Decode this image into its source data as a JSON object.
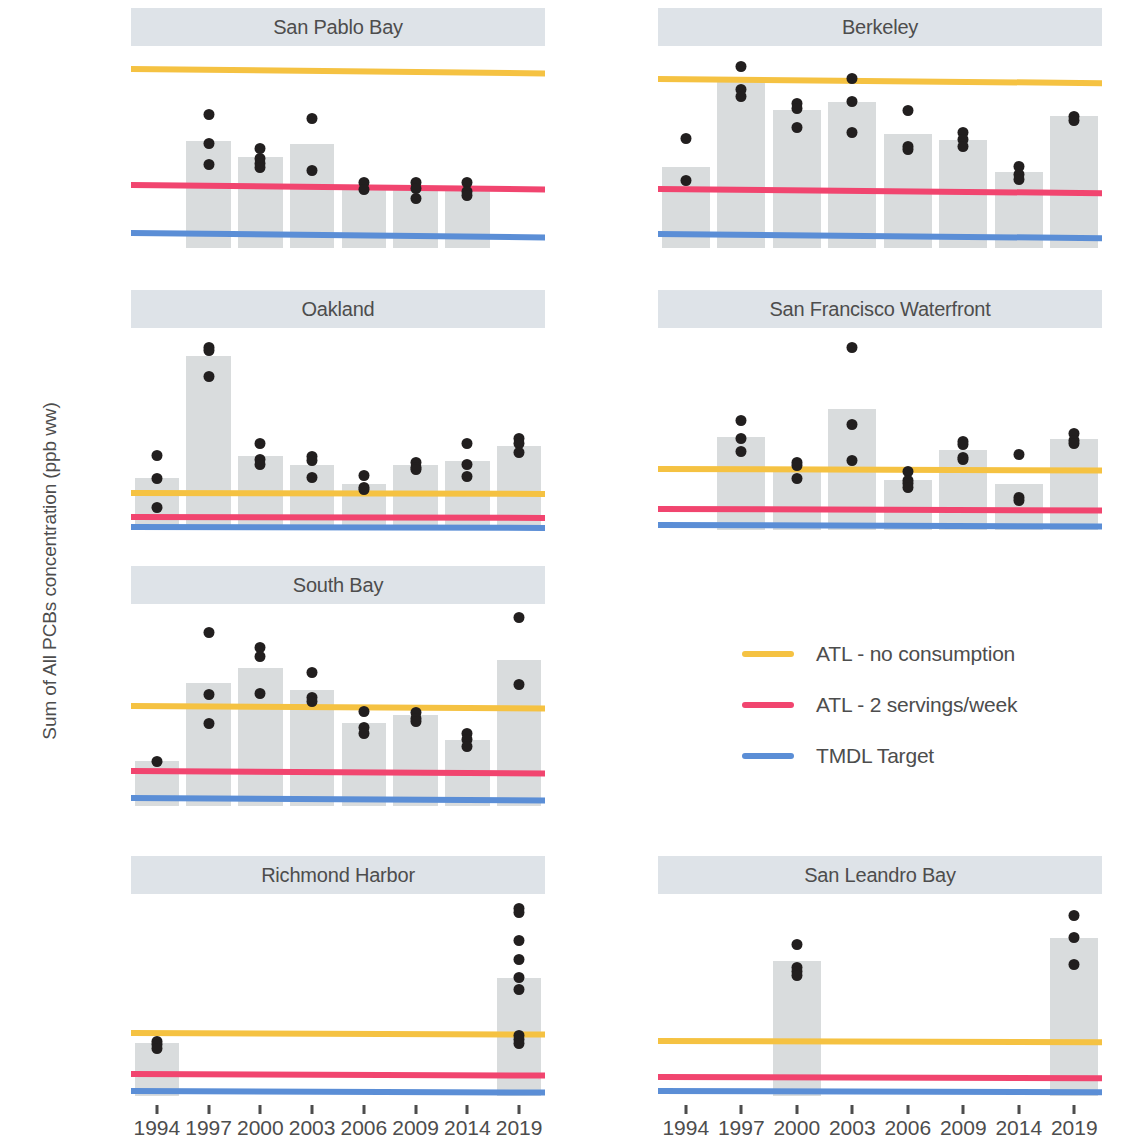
{
  "chart_data": {
    "type": "bar",
    "title": "",
    "xlabel": "",
    "ylabel": "Sum of All PCBs concentration (ppb ww)",
    "grid": false,
    "legend_position": "middle-right",
    "categories": [
      "1994",
      "1997",
      "2000",
      "2003",
      "2006",
      "2009",
      "2014",
      "2019"
    ],
    "reference_lines": [
      {
        "name": "ATL - no consumption",
        "color": "#f5c242",
        "value_left": 120,
        "value_right": 117
      },
      {
        "name": "ATL - 2 servings/week",
        "color": "#f1456f",
        "value_left": 42,
        "value_right": 39
      },
      {
        "name": "TMDL Target",
        "color": "#5b8ed6",
        "value_left": 10,
        "value_right": 7
      }
    ],
    "facets": [
      {
        "title": "San Pablo Bay",
        "row": 0,
        "col": 0,
        "ylim": [
          0,
          133
        ],
        "yticks": [
          0,
          25,
          50,
          75,
          100,
          125
        ],
        "bars": [
          null,
          72,
          61,
          70,
          40,
          39,
          39,
          null
        ],
        "points": [
          [],
          [
            90,
            70,
            56
          ],
          [
            67,
            60,
            57,
            54
          ],
          [
            87,
            52
          ],
          [
            44,
            39
          ],
          [
            44,
            40,
            33
          ],
          [
            44,
            38,
            35
          ],
          []
        ]
      },
      {
        "title": "Berkeley",
        "row": 0,
        "col": 1,
        "ylim": [
          0,
          141
        ],
        "yticks": [
          0,
          50,
          100
        ],
        "bars": [
          58,
          119,
          98,
          104,
          81,
          77,
          54,
          94
        ],
        "points": [
          [
            78,
            48
          ],
          [
            129,
            113,
            108
          ],
          [
            103,
            99,
            86
          ],
          [
            121,
            104,
            82
          ],
          [
            98,
            72,
            70
          ],
          [
            82,
            77,
            72
          ],
          [
            58,
            52,
            49
          ],
          [
            94,
            91
          ]
        ]
      },
      {
        "title": "Oakland",
        "row": 1,
        "col": 0,
        "ylim": [
          0,
          650
        ],
        "yticks": [
          0,
          200,
          400,
          600
        ],
        "bars": [
          170,
          570,
          243,
          213,
          152,
          213,
          227,
          277
        ],
        "points": [
          [
            245,
            168,
            74
          ],
          [
            600,
            588,
            503
          ],
          [
            285,
            230,
            215
          ],
          [
            240,
            228,
            172
          ],
          [
            180,
            140,
            133
          ],
          [
            222,
            205,
            198
          ],
          [
            285,
            215,
            175
          ],
          [
            300,
            283,
            255
          ]
        ]
      },
      {
        "title": "San Francisco Waterfront",
        "row": 1,
        "col": 1,
        "ylim": [
          0,
          390
        ],
        "yticks": [
          0,
          100,
          200,
          300
        ],
        "bars": [
          null,
          183,
          121,
          238,
          99,
          158,
          90,
          179
        ],
        "points": [
          [],
          [
            215,
            180,
            155
          ],
          [
            133,
            127,
            102
          ],
          [
            360,
            207,
            136
          ],
          [
            115,
            98,
            92,
            84
          ],
          [
            175,
            168,
            142,
            138
          ],
          [
            148,
            65,
            58
          ],
          [
            190,
            176,
            171
          ]
        ]
      },
      {
        "title": "South Bay",
        "row": 2,
        "col": 0,
        "ylim": [
          0,
          238
        ],
        "yticks": [
          0,
          50,
          100,
          150,
          200
        ],
        "bars": [
          54,
          148,
          166,
          139,
          100,
          109,
          79,
          176
        ],
        "points": [
          [
            53
          ],
          [
            209,
            134,
            99
          ],
          [
            190,
            180,
            135
          ],
          [
            160,
            131,
            126
          ],
          [
            114,
            94,
            87
          ],
          [
            112,
            105,
            101
          ],
          [
            87,
            80,
            72
          ],
          [
            227,
            146
          ]
        ]
      },
      {
        "title": "Richmond Harbor",
        "row": 3,
        "col": 0,
        "ylim": [
          0,
          380
        ],
        "yticks": [
          0,
          100,
          200,
          300
        ],
        "bars": [
          101,
          null,
          null,
          null,
          null,
          null,
          null,
          226
        ],
        "points": [
          [
            105,
            98,
            91
          ],
          [],
          [],
          [],
          [],
          [],
          [],
          [
            360,
            352,
            298,
            262,
            228,
            205,
            117,
            108,
            100
          ]
        ]
      },
      {
        "title": "San Leandro Bay",
        "row": 3,
        "col": 1,
        "ylim": [
          0,
          430
        ],
        "yticks": [
          0,
          100,
          200,
          300,
          400
        ],
        "bars": [
          null,
          null,
          293,
          null,
          null,
          null,
          null,
          343
        ],
        "points": [
          [],
          [],
          [
            328,
            280,
            271,
            262
          ],
          [],
          [],
          [],
          [],
          [
            393,
            344,
            285
          ]
        ]
      }
    ]
  },
  "legend": {
    "items": [
      {
        "label": "ATL - no consumption",
        "color": "#f5c242"
      },
      {
        "label": "ATL - 2 servings/week",
        "color": "#f1456f"
      },
      {
        "label": "TMDL Target",
        "color": "#5b8ed6"
      }
    ]
  }
}
